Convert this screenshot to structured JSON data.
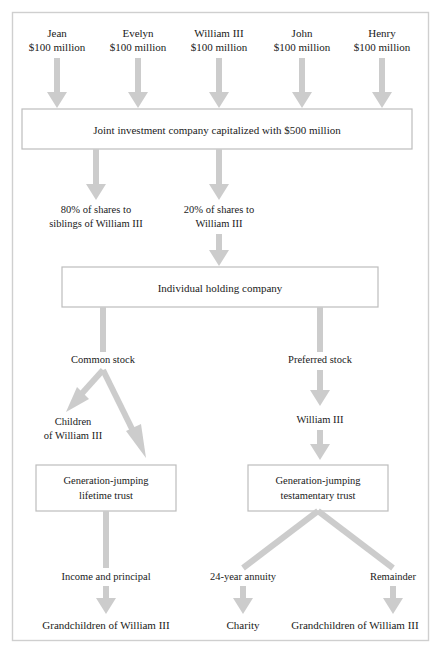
{
  "diagram": {
    "colors": {
      "arrow": "#cccccc",
      "box_border": "#bdbdbd",
      "frame": "#cfcfcf",
      "text": "#1a1a1a",
      "background": "#ffffff"
    },
    "contributors": [
      {
        "name": "Jean",
        "amount": "$100 million"
      },
      {
        "name": "Evelyn",
        "amount": "$100 million"
      },
      {
        "name": "William III",
        "amount": "$100 million"
      },
      {
        "name": "John",
        "amount": "$100 million"
      },
      {
        "name": "Henry",
        "amount": "$100 million"
      }
    ],
    "joint_company": "Joint investment company capitalized with $500 million",
    "share_split": [
      {
        "line1": "80% of shares to",
        "line2": "siblings of William III"
      },
      {
        "line1": "20% of shares to",
        "line2": "William III"
      }
    ],
    "holding_company": "Individual holding company",
    "stock_classes": {
      "common": "Common stock",
      "preferred": "Preferred stock"
    },
    "recipients": {
      "children": {
        "line1": "Children",
        "line2": "of William III"
      },
      "william": "William III"
    },
    "trusts": [
      {
        "line1": "Generation-jumping",
        "line2": "lifetime trust"
      },
      {
        "line1": "Generation-jumping",
        "line2": "testamentary trust"
      }
    ],
    "distributions": [
      "Income and principal",
      "24-year annuity",
      "Remainder"
    ],
    "beneficiaries": [
      "Grandchildren of William III",
      "Charity",
      "Grandchildren of William III"
    ]
  }
}
